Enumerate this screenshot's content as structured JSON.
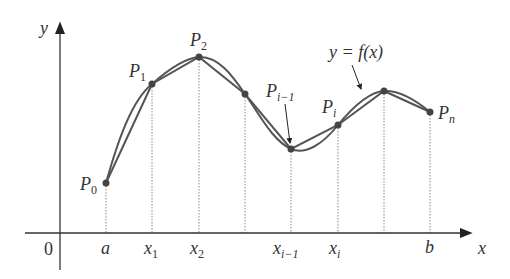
{
  "diagram": {
    "axes": {
      "x_label": "x",
      "y_label": "y",
      "origin_label": "0"
    },
    "curve_label": "y = f(x)",
    "tick_labels": [
      {
        "main": "a",
        "sub": ""
      },
      {
        "main": "x",
        "sub": "1"
      },
      {
        "main": "x",
        "sub": "2"
      },
      {
        "main": "x",
        "sub": "i−1"
      },
      {
        "main": "x",
        "sub": "i"
      },
      {
        "main": "b",
        "sub": ""
      }
    ],
    "point_labels": [
      {
        "main": "P",
        "sub": "0"
      },
      {
        "main": "P",
        "sub": "1"
      },
      {
        "main": "P",
        "sub": "2"
      },
      {
        "main": "P",
        "sub": "i−1"
      },
      {
        "main": "P",
        "sub": "i"
      },
      {
        "main": "P",
        "sub": "n"
      }
    ],
    "colors": {
      "curve": "#555555",
      "polygon": "#555555",
      "points": "#444444",
      "axes": "#333333",
      "dotted_lines": "#888888"
    }
  }
}
